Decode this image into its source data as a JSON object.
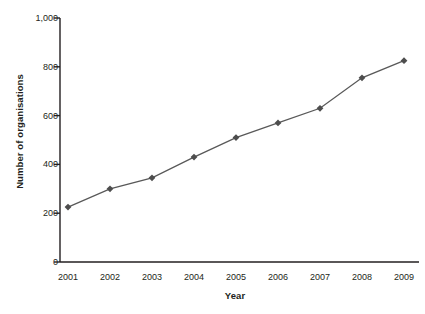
{
  "chart_data": {
    "type": "line",
    "title": "",
    "xlabel": "Year",
    "ylabel": "Number of organisations",
    "categories": [
      "2001",
      "2002",
      "2003",
      "2004",
      "2005",
      "2006",
      "2007",
      "2008",
      "2009"
    ],
    "values": [
      225,
      300,
      345,
      430,
      510,
      570,
      630,
      755,
      825
    ],
    "series": [
      {
        "name": "Number of organisations",
        "values": [
          225,
          300,
          345,
          430,
          510,
          570,
          630,
          755,
          825
        ]
      }
    ],
    "ylim": [
      0,
      1000
    ],
    "yticks": [
      0,
      200,
      400,
      600,
      800,
      1000
    ],
    "ytick_labels": [
      "0",
      "200",
      "400",
      "600",
      "800",
      "1,000"
    ],
    "grid": false,
    "legend": "none",
    "marker": "diamond",
    "line_color": "#595959",
    "marker_color": "#4d4d4d",
    "axis_color": "#231f20"
  }
}
